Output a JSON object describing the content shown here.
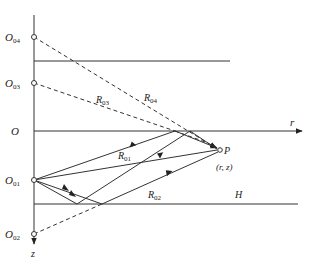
{
  "diagram": {
    "type": "image-source ray diagram",
    "axes": {
      "horizontal_label": "r",
      "vertical_label": "z",
      "origin_label": "O"
    },
    "sources": [
      {
        "name": "O",
        "sub": "04"
      },
      {
        "name": "O",
        "sub": "03"
      },
      {
        "name": "O",
        "sub": "01"
      },
      {
        "name": "O",
        "sub": "02"
      }
    ],
    "receiver": {
      "label": "P",
      "coords": "(r, z)"
    },
    "boundary_label": "H",
    "distances": [
      {
        "name": "R",
        "sub": "04"
      },
      {
        "name": "R",
        "sub": "03"
      },
      {
        "name": "R",
        "sub": "01"
      },
      {
        "name": "R",
        "sub": "02"
      }
    ],
    "colors": {
      "line": "#333333",
      "text": "#222222"
    }
  }
}
